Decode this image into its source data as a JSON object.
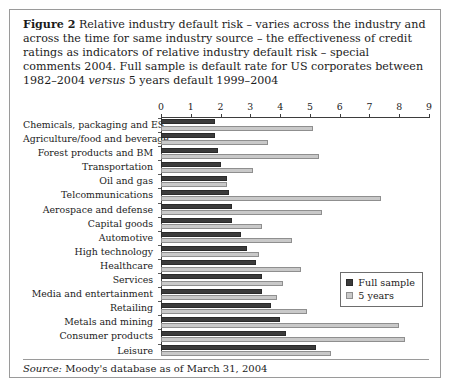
{
  "caption": {
    "figure_label": "Figure 2",
    "text_part1": "Relative industry default risk – varies across the industry and across the time for same industry source – the effectiveness of credit ratings as indicators of relative industry default risk – special comments 2004. Full sample is default rate for US corporates between 1982–2004 ",
    "italic_word": "versus",
    "text_part2": " 5 years default 1999–2004"
  },
  "source": {
    "label": "Source:",
    "text": " Moody's database as of March 31, 2004"
  },
  "legend": {
    "items": [
      {
        "label": "Full sample",
        "color": "#3b3b3b"
      },
      {
        "label": "5 years",
        "color": "#c9c9c9"
      }
    ]
  },
  "chart_data": {
    "type": "bar",
    "orientation": "horizontal",
    "title": "",
    "xlabel": "",
    "ylabel": "",
    "xlim": [
      0,
      9
    ],
    "xticks": [
      0,
      1,
      2,
      3,
      4,
      5,
      6,
      7,
      8,
      9
    ],
    "grid": false,
    "legend_position": "right-middle",
    "categories": [
      "Chemicals, packaging and ES",
      "Agriculture/food and beverage",
      "Forest products and BM",
      "Transportation",
      "Oil and gas",
      "Telcommunications",
      "Aerospace and defense",
      "Capital goods",
      "Automotive",
      "High technology",
      "Healthcare",
      "Services",
      "Media and entertainment",
      "Retailing",
      "Metals and mining",
      "Consumer products",
      "Leisure"
    ],
    "series": [
      {
        "name": "Full sample",
        "color": "#3b3b3b",
        "values": [
          1.8,
          1.8,
          1.9,
          2.0,
          2.2,
          2.3,
          2.4,
          2.4,
          2.7,
          2.9,
          3.2,
          3.4,
          3.4,
          3.7,
          4.0,
          4.2,
          5.2
        ]
      },
      {
        "name": "5 years",
        "color": "#c9c9c9",
        "values": [
          5.1,
          3.6,
          5.3,
          3.1,
          2.2,
          7.4,
          5.4,
          3.4,
          4.4,
          3.3,
          4.7,
          4.1,
          3.9,
          4.9,
          8.0,
          8.2,
          5.7
        ]
      }
    ]
  }
}
